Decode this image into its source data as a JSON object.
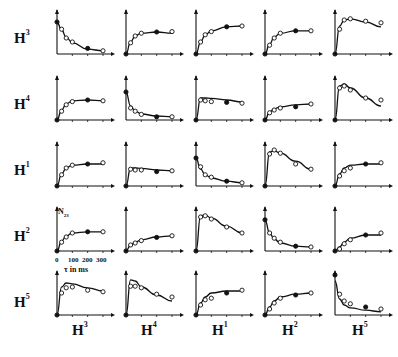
{
  "row_labels": [
    {
      "base": "H",
      "sup": "3"
    },
    {
      "base": "H",
      "sup": "4"
    },
    {
      "base": "H",
      "sup": "1"
    },
    {
      "base": "H",
      "sup": "2"
    },
    {
      "base": "H",
      "sup": "5"
    }
  ],
  "col_labels": [
    {
      "base": "H",
      "sup": "3"
    },
    {
      "base": "H",
      "sup": "4"
    },
    {
      "base": "H",
      "sup": "1"
    },
    {
      "base": "H",
      "sup": "2"
    },
    {
      "base": "H",
      "sup": "5"
    }
  ],
  "annotation": {
    "ylabel": "N",
    "ylabel_sub": "23",
    "xticks": [
      "0",
      "100",
      "200",
      "300"
    ],
    "xlabel": "τ in ms"
  },
  "chart_data": {
    "type": "line",
    "title": "",
    "layout": "5x5 grid of small multiples; rows H3,H4,H1,H2,H5; columns H3,H4,H1,H2,H5",
    "xlabel": "τ in ms",
    "ylabel": "N23",
    "xlim": [
      0,
      300
    ],
    "xticks": [
      0,
      100,
      200,
      300
    ],
    "x_points": [
      0,
      30,
      60,
      100,
      200,
      300
    ],
    "note": "Each panel shows a fitted curve (line) plus measured points (open circles, some filled). y values are relative (0–1) since y-axes carry no ticks.",
    "panels": [
      {
        "row": "H3",
        "col": "H3",
        "shape": "decay",
        "curve": [
          0.8,
          0.6,
          0.42,
          0.28,
          0.12,
          0.08
        ],
        "points": [
          0.8,
          0.62,
          0.4,
          0.3,
          0.14,
          0.08
        ]
      },
      {
        "row": "H3",
        "col": "H4",
        "shape": "rise",
        "curve": [
          0.0,
          0.3,
          0.45,
          0.52,
          0.55,
          0.52
        ],
        "points": [
          0.0,
          0.28,
          0.45,
          0.52,
          0.55,
          0.56
        ]
      },
      {
        "row": "H3",
        "col": "H1",
        "shape": "rise",
        "curve": [
          0.0,
          0.3,
          0.48,
          0.58,
          0.68,
          0.7
        ],
        "points": [
          0.0,
          0.3,
          0.48,
          0.56,
          0.68,
          0.7
        ]
      },
      {
        "row": "H3",
        "col": "H2",
        "shape": "rise",
        "curve": [
          0.0,
          0.25,
          0.42,
          0.52,
          0.58,
          0.58
        ],
        "points": [
          0.0,
          0.22,
          0.4,
          0.52,
          0.58,
          0.58
        ]
      },
      {
        "row": "H3",
        "col": "H5",
        "shape": "peak",
        "curve": [
          0.0,
          0.7,
          0.85,
          0.88,
          0.8,
          0.68
        ],
        "points": [
          0.0,
          0.62,
          0.85,
          0.88,
          0.82,
          0.78
        ]
      },
      {
        "row": "H4",
        "col": "H3",
        "shape": "rise",
        "curve": [
          0.0,
          0.25,
          0.4,
          0.48,
          0.5,
          0.48
        ],
        "points": [
          0.0,
          0.22,
          0.38,
          0.46,
          0.5,
          0.48
        ]
      },
      {
        "row": "H4",
        "col": "H4",
        "shape": "decay",
        "curve": [
          0.7,
          0.35,
          0.22,
          0.15,
          0.1,
          0.08
        ],
        "points": [
          0.7,
          0.3,
          0.22,
          0.14,
          0.08,
          0.08
        ]
      },
      {
        "row": "H4",
        "col": "H1",
        "shape": "plateau",
        "curve": [
          0.0,
          0.55,
          0.55,
          0.54,
          0.5,
          0.45
        ],
        "points": [
          0.0,
          0.5,
          0.48,
          0.46,
          0.44,
          0.42
        ]
      },
      {
        "row": "H4",
        "col": "H2",
        "shape": "rise",
        "curve": [
          0.0,
          0.2,
          0.28,
          0.33,
          0.38,
          0.4
        ],
        "points": [
          0.0,
          0.18,
          0.25,
          0.3,
          0.33,
          0.4
        ]
      },
      {
        "row": "H4",
        "col": "H5",
        "shape": "peak",
        "curve": [
          0.0,
          0.85,
          0.9,
          0.8,
          0.55,
          0.35
        ],
        "points": [
          0.0,
          0.8,
          0.85,
          0.75,
          0.55,
          0.5
        ]
      },
      {
        "row": "H1",
        "col": "H3",
        "shape": "rise",
        "curve": [
          0.0,
          0.3,
          0.45,
          0.52,
          0.55,
          0.55
        ],
        "points": [
          0.0,
          0.28,
          0.45,
          0.52,
          0.55,
          0.58
        ]
      },
      {
        "row": "H1",
        "col": "H4",
        "shape": "plateau",
        "curve": [
          0.0,
          0.45,
          0.45,
          0.44,
          0.4,
          0.38
        ],
        "points": [
          0.0,
          0.42,
          0.4,
          0.4,
          0.36,
          0.38
        ]
      },
      {
        "row": "H1",
        "col": "H1",
        "shape": "decay",
        "curve": [
          0.7,
          0.42,
          0.28,
          0.2,
          0.12,
          0.08
        ],
        "points": [
          0.7,
          0.48,
          0.28,
          0.22,
          0.12,
          0.08
        ]
      },
      {
        "row": "H1",
        "col": "H2",
        "shape": "peak",
        "curve": [
          0.0,
          0.85,
          0.88,
          0.82,
          0.62,
          0.42
        ],
        "points": [
          0.0,
          0.8,
          0.9,
          0.82,
          0.55,
          0.42
        ]
      },
      {
        "row": "H1",
        "col": "H5",
        "shape": "rise",
        "curve": [
          0.0,
          0.3,
          0.45,
          0.52,
          0.55,
          0.55
        ],
        "points": [
          0.0,
          0.25,
          0.38,
          0.45,
          0.55,
          0.58
        ]
      },
      {
        "row": "H2",
        "col": "H3",
        "shape": "rise",
        "curve": [
          0.0,
          0.25,
          0.38,
          0.45,
          0.48,
          0.48
        ],
        "points": [
          0.0,
          0.22,
          0.35,
          0.45,
          0.48,
          0.48
        ]
      },
      {
        "row": "H2",
        "col": "H4",
        "shape": "rise",
        "curve": [
          0.0,
          0.15,
          0.22,
          0.28,
          0.35,
          0.38
        ],
        "points": [
          0.0,
          0.15,
          0.2,
          0.26,
          0.34,
          0.38
        ]
      },
      {
        "row": "H2",
        "col": "H1",
        "shape": "peak",
        "curve": [
          0.0,
          0.88,
          0.9,
          0.82,
          0.62,
          0.45
        ],
        "points": [
          0.0,
          0.85,
          0.88,
          0.8,
          0.6,
          0.45
        ]
      },
      {
        "row": "H2",
        "col": "H2",
        "shape": "decay",
        "curve": [
          0.78,
          0.45,
          0.3,
          0.2,
          0.12,
          0.1
        ],
        "points": [
          0.78,
          0.45,
          0.32,
          0.22,
          0.12,
          0.1
        ]
      },
      {
        "row": "H2",
        "col": "H5",
        "shape": "rise",
        "curve": [
          0.0,
          0.1,
          0.22,
          0.32,
          0.4,
          0.4
        ],
        "points": [
          0.0,
          0.05,
          0.18,
          0.28,
          0.4,
          0.45
        ]
      },
      {
        "row": "H5",
        "col": "H3",
        "shape": "peak",
        "curve": [
          0.0,
          0.7,
          0.8,
          0.78,
          0.68,
          0.6
        ],
        "points": [
          0.0,
          0.55,
          0.68,
          0.7,
          0.62,
          0.58
        ]
      },
      {
        "row": "H5",
        "col": "H4",
        "shape": "peak",
        "curve": [
          0.0,
          0.88,
          0.85,
          0.7,
          0.5,
          0.35
        ],
        "points": [
          0.0,
          0.72,
          0.72,
          0.68,
          0.52,
          0.45
        ]
      },
      {
        "row": "H5",
        "col": "H1",
        "shape": "rise",
        "curve": [
          0.0,
          0.3,
          0.45,
          0.55,
          0.6,
          0.6
        ],
        "points": [
          0.0,
          0.25,
          0.38,
          0.42,
          0.55,
          0.62
        ]
      },
      {
        "row": "H5",
        "col": "H2",
        "shape": "rise",
        "curve": [
          0.0,
          0.2,
          0.35,
          0.45,
          0.52,
          0.55
        ],
        "points": [
          0.0,
          0.15,
          0.3,
          0.42,
          0.5,
          0.55
        ]
      },
      {
        "row": "H5",
        "col": "H5",
        "shape": "decay",
        "curve": [
          0.85,
          0.4,
          0.25,
          0.18,
          0.12,
          0.08
        ],
        "points": [
          1.0,
          0.52,
          0.35,
          0.28,
          0.2,
          0.15
        ]
      }
    ]
  }
}
